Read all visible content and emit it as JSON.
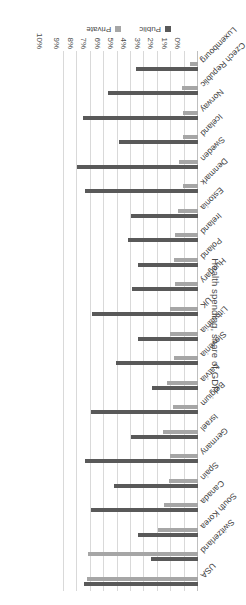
{
  "chart_data": {
    "type": "bar",
    "orientation": "horizontal",
    "title": "",
    "xlabel": "",
    "ylabel": "Health spending, share of GDP",
    "axis_title": "Health spending, share of GDP",
    "tick_labels": [
      "0%",
      "1%",
      "2%",
      "3%",
      "4%",
      "5%",
      "6%",
      "7%",
      "8%",
      "9%",
      "10%"
    ],
    "xlim": [
      0,
      10
    ],
    "grid": true,
    "legend_position": "bottom-left",
    "rotated_180": true,
    "colors": {
      "public": "#595959",
      "private": "#a6a6a6",
      "gridline": "#d9d9d9",
      "text": "#4a4a4a"
    },
    "legend": [
      {
        "name": "Public",
        "color": "#595959"
      },
      {
        "name": "Private",
        "color": "#a6a6a6"
      }
    ],
    "categories": [
      "USA",
      "Switzerland",
      "South Korea",
      "Canada",
      "Spain",
      "Germany",
      "Israel",
      "Belgium",
      "Latvia",
      "Slovenia",
      "Lithuania",
      "UK",
      "Hungary",
      "Poland",
      "Ireland",
      "Estonia",
      "Denmark",
      "Sweden",
      "Iceland",
      "Norway",
      "Czech Republic",
      "Luxembourg"
    ],
    "series": [
      {
        "name": "Public",
        "values": [
          8.5,
          3.5,
          4.5,
          8.0,
          6.3,
          8.4,
          5.0,
          8.0,
          3.4,
          6.1,
          4.5,
          7.9,
          4.9,
          4.5,
          5.2,
          5.0,
          8.4,
          9.0,
          5.9,
          8.6,
          6.7,
          4.6
        ]
      },
      {
        "name": "Private",
        "values": [
          8.3,
          8.2,
          3.0,
          2.5,
          2.2,
          2.1,
          2.6,
          1.9,
          2.3,
          1.8,
          2.1,
          2.1,
          1.7,
          1.8,
          1.7,
          1.5,
          1.1,
          1.4,
          1.1,
          1.1,
          1.2,
          0.6
        ]
      }
    ]
  }
}
